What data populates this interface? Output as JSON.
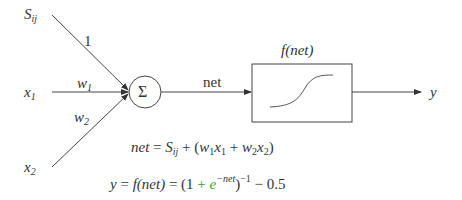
{
  "diagram": {
    "inputs": [
      {
        "id": "s",
        "label": "S",
        "subscript": "ij",
        "weight_label": "1"
      },
      {
        "id": "x1",
        "label": "x",
        "subscript": "1",
        "weight_label": "w",
        "weight_subscript": "1"
      },
      {
        "id": "x2",
        "label": "x",
        "subscript": "2",
        "weight_label": "w",
        "weight_subscript": "2"
      }
    ],
    "summation_node": {
      "symbol": "Σ"
    },
    "net_edge_label": "net",
    "activation_box": {
      "label": "f(net)",
      "curve": "sigmoid"
    },
    "output": {
      "label": "y"
    },
    "equations": {
      "net": {
        "lhs": "net",
        "eq": "=",
        "S": "S",
        "S_sub": "ij",
        "rest_open": "+ (",
        "w1": "w",
        "w1_sub": "1",
        "x1": "x",
        "x1_sub": "1",
        "plus": "+",
        "w2": "w",
        "w2_sub": "2",
        "x2": "x",
        "x2_sub": "2",
        "close": ")"
      },
      "output": {
        "lhs": "y",
        "eq1": "=",
        "f": "f(net)",
        "eq2": "=",
        "open": "(1",
        "plus": "+",
        "e": "e",
        "exp": "−net",
        "close": ")",
        "inv": "−1",
        "minus": "− 0.5"
      }
    },
    "colors": {
      "line": "#333333",
      "accent_green": "#3d9a3d"
    }
  }
}
